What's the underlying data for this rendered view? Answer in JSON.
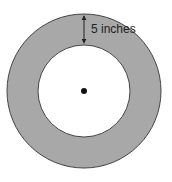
{
  "diagram": {
    "type": "annulus",
    "outer_circle": {
      "cx": 84,
      "cy": 91,
      "r": 77
    },
    "inner_circle": {
      "cx": 84,
      "cy": 91,
      "r": 46
    },
    "center_point": {
      "cx": 84,
      "cy": 91,
      "r": 3
    },
    "dimension": {
      "label": "5 inches",
      "x": 84,
      "y_top": 14,
      "y_bottom": 45
    },
    "colors": {
      "ring_fill": "#a8a8a8",
      "ring_stroke": "#444444",
      "inner_fill": "#ffffff",
      "dot": "#111111",
      "arrow": "#222222",
      "text": "#222222"
    }
  }
}
